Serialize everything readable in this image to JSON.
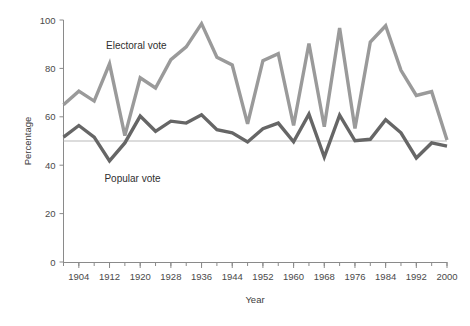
{
  "chart_data": {
    "type": "line",
    "title": "",
    "xlabel": "Year",
    "ylabel": "Percentage",
    "xlim": [
      1900,
      2000
    ],
    "ylim": [
      0,
      100
    ],
    "grid": false,
    "legend_position": "inline-annotation",
    "x_major_ticks": [
      1904,
      1912,
      1920,
      1928,
      1936,
      1944,
      1952,
      1960,
      1968,
      1976,
      1984,
      1992,
      2000
    ],
    "x_minor_tick_step": 4,
    "y_ticks": [
      0,
      20,
      40,
      60,
      80,
      100
    ],
    "reference_line": {
      "value": 50,
      "color": "#b9b9b9"
    },
    "x": [
      1900,
      1904,
      1908,
      1912,
      1916,
      1920,
      1924,
      1928,
      1932,
      1936,
      1940,
      1944,
      1948,
      1952,
      1956,
      1960,
      1964,
      1968,
      1972,
      1976,
      1980,
      1984,
      1988,
      1992,
      1996,
      2000
    ],
    "series": [
      {
        "name": "Electoral vote",
        "color": "#9a9a9a",
        "values": [
          65,
          70.6,
          66.5,
          81.9,
          52.2,
          76.1,
          71.9,
          83.6,
          88.9,
          98.5,
          84.6,
          81.4,
          57.1,
          83.2,
          86.1,
          56.4,
          90.3,
          55.9,
          96.7,
          55.2,
          90.9,
          97.6,
          79.2,
          68.8,
          70.4,
          50.4
        ],
        "label": "Electoral vote"
      },
      {
        "name": "Popular vote",
        "color": "#666666",
        "values": [
          51.6,
          56.4,
          51.6,
          41.8,
          49.2,
          60.3,
          54.0,
          58.2,
          57.4,
          60.8,
          54.7,
          53.4,
          49.6,
          55.1,
          57.4,
          49.7,
          61.1,
          43.4,
          60.7,
          50.1,
          50.7,
          58.8,
          53.4,
          43.0,
          49.2,
          47.9
        ],
        "label": "Popular vote"
      }
    ],
    "annotations": [
      {
        "text": "Electoral vote",
        "x": 1919,
        "y": 88
      },
      {
        "text": "Popular vote",
        "x": 1918,
        "y": 33
      }
    ]
  }
}
